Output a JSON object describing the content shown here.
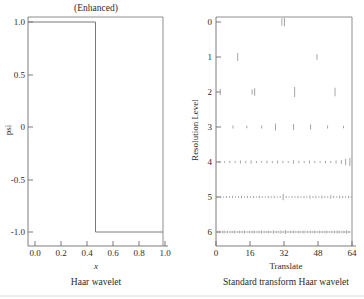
{
  "figure": {
    "width": 364,
    "height": 299,
    "background": "#ffffff",
    "ink_color": "#7a7a7a"
  },
  "chart_data": [
    {
      "id": "haar-wavelet",
      "type": "line",
      "title": "(Enhanced)",
      "caption": "Haar wavelet",
      "xlabel": "x",
      "ylabel": "psi",
      "xlim": [
        0.0,
        1.0
      ],
      "ylim": [
        -1.0,
        1.0
      ],
      "xticks": [
        0.0,
        0.2,
        0.4,
        0.6,
        0.8,
        1.0
      ],
      "xtick_labels": [
        "0.0",
        "0.2",
        "0.4",
        "0.6",
        "0.8",
        "1.0"
      ],
      "yticks": [
        -1.0,
        -0.5,
        0.0,
        0.5,
        1.0
      ],
      "ytick_labels": [
        "-1.0",
        "-0.5",
        "0",
        "0.5",
        "1.0"
      ],
      "grid": false,
      "legend": "none",
      "x": [
        0.0,
        0.5,
        0.5,
        1.0
      ],
      "y": [
        1.0,
        1.0,
        -1.0,
        -1.0
      ]
    },
    {
      "id": "standard-transform-haar",
      "type": "scatter",
      "title": "",
      "caption": "Standard transform Haar wavelet",
      "xlabel": "Translate",
      "ylabel": "Resolution Level",
      "xlim": [
        0,
        64
      ],
      "ylim": [
        -0.6,
        6.6
      ],
      "xticks": [
        0,
        16,
        32,
        48,
        64
      ],
      "xtick_labels": [
        "0",
        "16",
        "32",
        "48",
        "64"
      ],
      "yticks": [
        0,
        1,
        2,
        3,
        4,
        5,
        6
      ],
      "ytick_labels": [
        "0",
        "1",
        "2",
        "3",
        "4",
        "5",
        "6"
      ],
      "grid": false,
      "legend": "none",
      "marker": "vertical-line-segment",
      "series": [
        {
          "name": "level-0",
          "level": 0,
          "points": [
            {
              "x": 31.0,
              "h": 7.5
            },
            {
              "x": 32.2,
              "h": 9.0
            }
          ]
        },
        {
          "name": "level-1",
          "level": 1,
          "points": [
            {
              "x": 10.2,
              "h": 8.0
            },
            {
              "x": 47.5,
              "h": 5.5
            }
          ]
        },
        {
          "name": "level-2",
          "level": 2,
          "points": [
            {
              "x": 2.0,
              "h": 6.5
            },
            {
              "x": 17.0,
              "h": 5.0
            },
            {
              "x": 18.2,
              "h": 7.5
            },
            {
              "x": 37.0,
              "h": 10.0
            },
            {
              "x": 56.0,
              "h": 8.5
            }
          ]
        },
        {
          "name": "level-3",
          "level": 3,
          "points": [
            {
              "x": 8.0,
              "h": 3.0
            },
            {
              "x": 14.5,
              "h": 2.5
            },
            {
              "x": 21.5,
              "h": 3.0
            },
            {
              "x": 28.0,
              "h": 7.0
            },
            {
              "x": 36.5,
              "h": 6.0
            },
            {
              "x": 44.5,
              "h": 5.0
            },
            {
              "x": 52.5,
              "h": 3.0
            },
            {
              "x": 60.0,
              "h": 2.5
            }
          ]
        },
        {
          "name": "level-4",
          "level": 4,
          "points": [
            {
              "x": 1.5,
              "h": 2.0
            },
            {
              "x": 4.0,
              "h": 1.6
            },
            {
              "x": 6.5,
              "h": 2.4
            },
            {
              "x": 9.0,
              "h": 1.8
            },
            {
              "x": 11.5,
              "h": 3.0
            },
            {
              "x": 14.0,
              "h": 2.2
            },
            {
              "x": 16.5,
              "h": 3.4
            },
            {
              "x": 19.0,
              "h": 2.0
            },
            {
              "x": 21.5,
              "h": 1.6
            },
            {
              "x": 24.0,
              "h": 2.6
            },
            {
              "x": 26.5,
              "h": 2.0
            },
            {
              "x": 29.0,
              "h": 3.0
            },
            {
              "x": 31.5,
              "h": 2.2
            },
            {
              "x": 34.0,
              "h": 1.8
            },
            {
              "x": 36.5,
              "h": 3.6
            },
            {
              "x": 39.0,
              "h": 2.4
            },
            {
              "x": 41.5,
              "h": 2.0
            },
            {
              "x": 44.0,
              "h": 3.0
            },
            {
              "x": 46.5,
              "h": 2.2
            },
            {
              "x": 49.0,
              "h": 1.8
            },
            {
              "x": 51.5,
              "h": 2.4
            },
            {
              "x": 54.0,
              "h": 2.0
            },
            {
              "x": 56.5,
              "h": 3.0
            },
            {
              "x": 59.0,
              "h": 4.0
            },
            {
              "x": 61.0,
              "h": 6.5
            },
            {
              "x": 63.0,
              "h": 8.0
            }
          ]
        },
        {
          "name": "level-5",
          "level": 5,
          "points": [
            {
              "x": 0.8,
              "h": 1.6
            },
            {
              "x": 2.2,
              "h": 2.4
            },
            {
              "x": 3.6,
              "h": 1.4
            },
            {
              "x": 5.0,
              "h": 2.0
            },
            {
              "x": 6.4,
              "h": 1.6
            },
            {
              "x": 7.8,
              "h": 2.2
            },
            {
              "x": 9.2,
              "h": 1.4
            },
            {
              "x": 10.6,
              "h": 1.8
            },
            {
              "x": 12.0,
              "h": 2.6
            },
            {
              "x": 13.4,
              "h": 1.4
            },
            {
              "x": 14.8,
              "h": 2.0
            },
            {
              "x": 16.2,
              "h": 1.6
            },
            {
              "x": 17.6,
              "h": 2.2
            },
            {
              "x": 19.0,
              "h": 1.4
            },
            {
              "x": 20.4,
              "h": 2.6
            },
            {
              "x": 21.8,
              "h": 1.8
            },
            {
              "x": 23.2,
              "h": 1.4
            },
            {
              "x": 24.6,
              "h": 2.0
            },
            {
              "x": 26.0,
              "h": 1.6
            },
            {
              "x": 27.4,
              "h": 2.4
            },
            {
              "x": 28.8,
              "h": 1.4
            },
            {
              "x": 30.2,
              "h": 1.8
            },
            {
              "x": 31.6,
              "h": 6.5
            },
            {
              "x": 33.0,
              "h": 2.0
            },
            {
              "x": 34.4,
              "h": 1.4
            },
            {
              "x": 35.8,
              "h": 1.8
            },
            {
              "x": 37.2,
              "h": 1.6
            },
            {
              "x": 38.6,
              "h": 2.2
            },
            {
              "x": 40.0,
              "h": 1.4
            },
            {
              "x": 41.4,
              "h": 2.0
            },
            {
              "x": 42.8,
              "h": 1.6
            },
            {
              "x": 44.2,
              "h": 3.4
            },
            {
              "x": 45.6,
              "h": 1.8
            },
            {
              "x": 47.0,
              "h": 2.6
            },
            {
              "x": 48.4,
              "h": 1.4
            },
            {
              "x": 49.8,
              "h": 3.0
            },
            {
              "x": 51.2,
              "h": 2.0
            },
            {
              "x": 52.6,
              "h": 1.6
            },
            {
              "x": 54.0,
              "h": 3.4
            },
            {
              "x": 55.4,
              "h": 2.2
            },
            {
              "x": 56.8,
              "h": 1.4
            },
            {
              "x": 58.2,
              "h": 3.0
            },
            {
              "x": 59.6,
              "h": 2.0
            },
            {
              "x": 61.0,
              "h": 1.6
            },
            {
              "x": 62.4,
              "h": 2.4
            },
            {
              "x": 63.6,
              "h": 1.4
            }
          ]
        },
        {
          "name": "level-6",
          "level": 6,
          "points": [
            {
              "x": 0.6,
              "h": 1.8
            },
            {
              "x": 1.4,
              "h": 2.6
            },
            {
              "x": 2.2,
              "h": 1.4
            },
            {
              "x": 3.0,
              "h": 2.0
            },
            {
              "x": 3.8,
              "h": 3.2
            },
            {
              "x": 4.6,
              "h": 1.6
            },
            {
              "x": 5.4,
              "h": 2.2
            },
            {
              "x": 6.2,
              "h": 1.4
            },
            {
              "x": 7.0,
              "h": 2.8
            },
            {
              "x": 7.8,
              "h": 1.8
            },
            {
              "x": 8.6,
              "h": 3.4
            },
            {
              "x": 9.4,
              "h": 1.4
            },
            {
              "x": 10.2,
              "h": 2.0
            },
            {
              "x": 11.0,
              "h": 2.6
            },
            {
              "x": 11.8,
              "h": 1.6
            },
            {
              "x": 12.6,
              "h": 2.2
            },
            {
              "x": 13.4,
              "h": 3.0
            },
            {
              "x": 14.2,
              "h": 1.4
            },
            {
              "x": 15.0,
              "h": 1.8
            },
            {
              "x": 15.8,
              "h": 2.4
            },
            {
              "x": 16.6,
              "h": 1.6
            },
            {
              "x": 17.4,
              "h": 3.2
            },
            {
              "x": 18.2,
              "h": 2.0
            },
            {
              "x": 19.0,
              "h": 1.4
            },
            {
              "x": 19.8,
              "h": 2.6
            },
            {
              "x": 20.6,
              "h": 1.8
            },
            {
              "x": 21.4,
              "h": 3.0
            },
            {
              "x": 22.2,
              "h": 1.4
            },
            {
              "x": 23.0,
              "h": 2.2
            },
            {
              "x": 23.8,
              "h": 1.6
            },
            {
              "x": 24.6,
              "h": 2.8
            },
            {
              "x": 25.4,
              "h": 2.0
            },
            {
              "x": 26.2,
              "h": 1.4
            },
            {
              "x": 27.0,
              "h": 3.4
            },
            {
              "x": 27.8,
              "h": 1.8
            },
            {
              "x": 28.6,
              "h": 2.4
            },
            {
              "x": 29.4,
              "h": 1.6
            },
            {
              "x": 30.2,
              "h": 3.0
            },
            {
              "x": 31.0,
              "h": 2.2
            },
            {
              "x": 31.8,
              "h": 1.4
            },
            {
              "x": 32.6,
              "h": 4.0
            },
            {
              "x": 33.4,
              "h": 2.0
            },
            {
              "x": 34.2,
              "h": 1.6
            },
            {
              "x": 35.0,
              "h": 2.6
            },
            {
              "x": 35.8,
              "h": 1.8
            },
            {
              "x": 36.6,
              "h": 3.2
            },
            {
              "x": 37.4,
              "h": 1.4
            },
            {
              "x": 38.2,
              "h": 2.2
            },
            {
              "x": 39.0,
              "h": 2.8
            },
            {
              "x": 39.8,
              "h": 1.6
            },
            {
              "x": 40.6,
              "h": 2.0
            },
            {
              "x": 41.4,
              "h": 3.0
            },
            {
              "x": 42.2,
              "h": 1.4
            },
            {
              "x": 43.0,
              "h": 2.4
            },
            {
              "x": 43.8,
              "h": 1.8
            },
            {
              "x": 44.6,
              "h": 2.6
            },
            {
              "x": 45.4,
              "h": 1.6
            },
            {
              "x": 46.2,
              "h": 3.0
            },
            {
              "x": 47.0,
              "h": 2.0
            },
            {
              "x": 47.8,
              "h": 1.4
            },
            {
              "x": 48.6,
              "h": 2.8
            },
            {
              "x": 49.4,
              "h": 1.8
            },
            {
              "x": 50.2,
              "h": 2.2
            },
            {
              "x": 51.0,
              "h": 1.6
            },
            {
              "x": 51.8,
              "h": 3.2
            },
            {
              "x": 52.6,
              "h": 2.0
            },
            {
              "x": 53.4,
              "h": 1.4
            },
            {
              "x": 54.2,
              "h": 2.6
            },
            {
              "x": 55.0,
              "h": 1.8
            },
            {
              "x": 55.8,
              "h": 2.4
            },
            {
              "x": 56.6,
              "h": 1.6
            },
            {
              "x": 57.4,
              "h": 3.0
            },
            {
              "x": 58.2,
              "h": 2.2
            },
            {
              "x": 59.0,
              "h": 1.4
            },
            {
              "x": 59.8,
              "h": 2.8
            },
            {
              "x": 60.6,
              "h": 2.0
            },
            {
              "x": 61.4,
              "h": 3.4
            },
            {
              "x": 62.2,
              "h": 2.6
            },
            {
              "x": 63.0,
              "h": 2.0
            }
          ]
        }
      ]
    }
  ]
}
